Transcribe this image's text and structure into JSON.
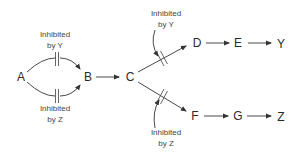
{
  "diagram": {
    "type": "metabolic-pathway-feedback-inhibition",
    "nodes": [
      {
        "id": "A",
        "label": "A"
      },
      {
        "id": "B",
        "label": "B"
      },
      {
        "id": "C",
        "label": "C"
      },
      {
        "id": "D",
        "label": "D"
      },
      {
        "id": "E",
        "label": "E"
      },
      {
        "id": "Y",
        "label": "Y"
      },
      {
        "id": "F",
        "label": "F"
      },
      {
        "id": "G",
        "label": "G"
      },
      {
        "id": "Z",
        "label": "Z"
      }
    ],
    "edges": [
      {
        "from": "A",
        "to": "B",
        "route": "upper",
        "inhibited_by": "Y"
      },
      {
        "from": "A",
        "to": "B",
        "route": "lower",
        "inhibited_by": "Z"
      },
      {
        "from": "B",
        "to": "C"
      },
      {
        "from": "C",
        "to": "D",
        "inhibited_by": "Y"
      },
      {
        "from": "D",
        "to": "E"
      },
      {
        "from": "E",
        "to": "Y"
      },
      {
        "from": "C",
        "to": "F",
        "inhibited_by": "Z"
      },
      {
        "from": "F",
        "to": "G"
      },
      {
        "from": "G",
        "to": "Z"
      }
    ],
    "labels": {
      "ab_upper": {
        "line1": "Inhibited",
        "line2": "by Y"
      },
      "ab_lower": {
        "line1": "Inhibited",
        "line2": "by Z"
      },
      "cd": {
        "line1": "Inhibited",
        "line2": "by Y"
      },
      "cf": {
        "line1": "Inhibited",
        "line2": "by Z"
      }
    },
    "colors": {
      "stroke": "#333333",
      "text": "#2a2a2a"
    }
  }
}
